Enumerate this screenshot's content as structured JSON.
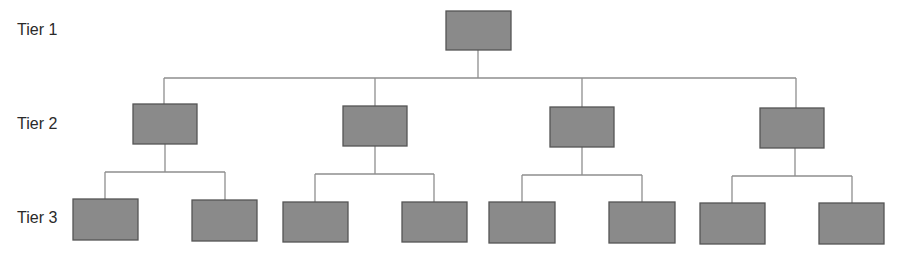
{
  "labels": {
    "tier1": "Tier 1",
    "tier2": "Tier 2",
    "tier3": "Tier 3"
  },
  "colors": {
    "node_fill": "#8a8a8a",
    "node_stroke": "#555555",
    "edge": "#8e8e8e",
    "text": "#2a2a2a"
  },
  "hierarchy": {
    "tier1": [
      {
        "id": "root",
        "children": [
          "t2a",
          "t2b",
          "t2c",
          "t2d"
        ]
      }
    ],
    "tier2": [
      {
        "id": "t2a",
        "children": [
          "t3a1",
          "t3a2"
        ]
      },
      {
        "id": "t2b",
        "children": [
          "t3b1",
          "t3b2"
        ]
      },
      {
        "id": "t2c",
        "children": [
          "t3c1",
          "t3c2"
        ]
      },
      {
        "id": "t2d",
        "children": [
          "t3d1",
          "t3d2"
        ]
      }
    ],
    "tier3_count": 8
  }
}
